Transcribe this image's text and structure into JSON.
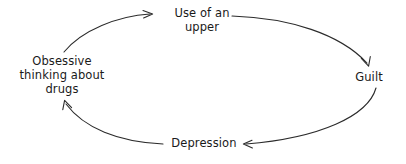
{
  "diagram": {
    "type": "cycle-diagram",
    "background_color": "#ffffff",
    "stroke_color": "#2b2b2b",
    "text_color": "#1a1a1a",
    "nodes": [
      {
        "id": "upper",
        "label": "Use of an upper",
        "lines": [
          "Use of an",
          "upper"
        ],
        "position": "top"
      },
      {
        "id": "guilt",
        "label": "Guilt",
        "lines": [
          "Guilt"
        ],
        "position": "right"
      },
      {
        "id": "depression",
        "label": "Depression",
        "lines": [
          "Depression"
        ],
        "position": "bottom"
      },
      {
        "id": "obsessive",
        "label": "Obsessive thinking about drugs",
        "lines": [
          "Obsessive",
          "thinking about",
          "drugs"
        ],
        "position": "left"
      }
    ],
    "edges": [
      {
        "id": "edge-obsessive-to-upper",
        "from": "obsessive",
        "to": "upper",
        "arrow": "to"
      },
      {
        "id": "edge-upper-to-guilt",
        "from": "upper",
        "to": "guilt",
        "arrow": "to"
      },
      {
        "id": "edge-guilt-to-depression",
        "from": "guilt",
        "to": "depression",
        "arrow": "to"
      },
      {
        "id": "edge-depression-to-obsessive",
        "from": "depression",
        "to": "obsessive",
        "arrow": "to"
      }
    ]
  }
}
